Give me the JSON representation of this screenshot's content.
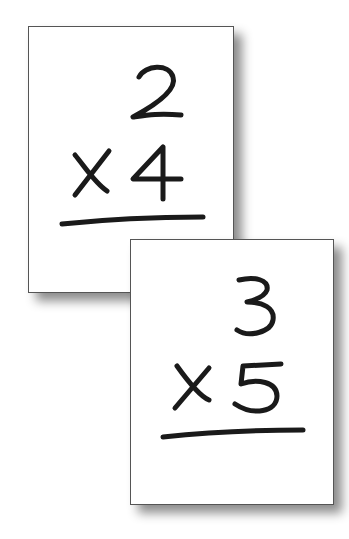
{
  "cards": [
    {
      "top": "2",
      "operator": "x",
      "bottom": "4"
    },
    {
      "top": "3",
      "operator": "x",
      "bottom": "5"
    }
  ]
}
